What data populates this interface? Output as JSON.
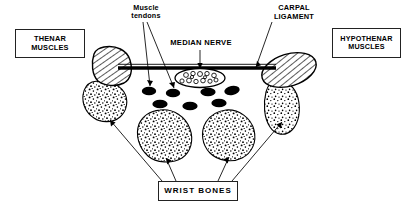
{
  "diagram": {
    "labels": {
      "thenar": "THENAR\nMUSCLES",
      "thenar_line1": "THENAR",
      "thenar_line2": "MUSCLES",
      "hypothenar_line1": "HYPOTHENAR",
      "hypothenar_line2": "MUSCLES",
      "wrist_bones": "WRIST  BONES",
      "muscle_tendons_line1": "Muscle",
      "muscle_tendons_line2": "tendons",
      "median_nerve": "MEDIAN NERVE",
      "carpal_ligament_line1": "CARPAL",
      "carpal_ligament_line2": "LIGAMENT"
    },
    "colors": {
      "ink": "#000000",
      "background": "#ffffff",
      "box_border": "#222222",
      "tendon_fill": "#000000",
      "nerve_fill": "#ffffff"
    },
    "structures": {
      "carpal_ligament": {
        "kind": "band",
        "x1": 118,
        "x2": 276,
        "y": 68,
        "thickness": 3
      },
      "median_nerve": {
        "kind": "stippled-ellipse",
        "cx": 200,
        "cy": 78,
        "rx": 24,
        "ry": 9,
        "inner_circles": 18
      },
      "tendons_upper": [
        {
          "cx": 149,
          "cy": 91,
          "rx": 7,
          "ry": 4.2
        },
        {
          "cx": 173,
          "cy": 93,
          "rx": 7,
          "ry": 4.2
        },
        {
          "cx": 208,
          "cy": 92,
          "rx": 7.5,
          "ry": 4.2
        },
        {
          "cx": 232,
          "cy": 91,
          "rx": 7.5,
          "ry": 4.4
        }
      ],
      "tendons_lower": [
        {
          "cx": 160,
          "cy": 104,
          "rx": 7.5,
          "ry": 4.2
        },
        {
          "cx": 190,
          "cy": 106,
          "rx": 7.5,
          "ry": 4.2
        },
        {
          "cx": 219,
          "cy": 103,
          "rx": 7.5,
          "ry": 4.2
        }
      ],
      "thenar_muscle": {
        "kind": "hatched-round",
        "cx": 112,
        "cy": 64,
        "rx": 19,
        "ry": 18
      },
      "hypothenar_muscle": {
        "kind": "hatched-ellipse",
        "cx": 289,
        "cy": 70,
        "rx": 27,
        "ry": 16,
        "rotation": -18
      },
      "wrist_bones": [
        {
          "id": "bone-left-outer",
          "cx": 104,
          "cy": 101,
          "rx": 22,
          "ry": 19
        },
        {
          "id": "bone-left-inner",
          "cx": 164,
          "cy": 134,
          "rx": 27,
          "ry": 24
        },
        {
          "id": "bone-right-inner",
          "cx": 227,
          "cy": 134,
          "rx": 26,
          "ry": 24
        },
        {
          "id": "bone-right-outer",
          "cx": 283,
          "cy": 104,
          "rx": 20,
          "ry": 22
        }
      ]
    }
  }
}
